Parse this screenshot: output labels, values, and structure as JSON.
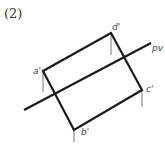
{
  "figure": {
    "label": "(2)"
  },
  "diagram": {
    "points": {
      "a": {
        "label": "a'",
        "x": 43,
        "y": 71
      },
      "b": {
        "label": "b'",
        "x": 74,
        "y": 130
      },
      "c": {
        "label": "c'",
        "x": 142,
        "y": 90
      },
      "d": {
        "label": "d'",
        "x": 111,
        "y": 33
      }
    },
    "line": {
      "label": "pv",
      "x1": 24,
      "y1": 110,
      "x2": 151,
      "y2": 43
    },
    "stroke_color": "#1a1a1a",
    "tick_color": "#666666"
  }
}
